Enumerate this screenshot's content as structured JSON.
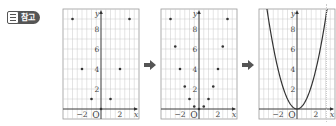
{
  "badge": {
    "label": "참고",
    "icon": "document-icon"
  },
  "arrows": [
    {
      "icon": "right-arrow-icon"
    },
    {
      "icon": "right-arrow-icon"
    }
  ],
  "graphs": {
    "axis_labels": {
      "x": "x",
      "y": "y",
      "origin": "O"
    },
    "x_ticks": [
      "−2",
      "2"
    ],
    "y_ticks": [
      "2",
      "4",
      "6",
      "8"
    ]
  },
  "chart_data": [
    {
      "type": "scatter",
      "title": "",
      "xlabel": "x",
      "ylabel": "y",
      "xlim": [
        -4,
        4
      ],
      "ylim": [
        -1,
        10
      ],
      "grid": true,
      "x": [
        -3,
        -2,
        -1,
        0,
        1,
        2,
        3
      ],
      "y": [
        9,
        4,
        1,
        0,
        1,
        4,
        9
      ]
    },
    {
      "type": "scatter",
      "title": "",
      "xlabel": "x",
      "ylabel": "y",
      "xlim": [
        -4,
        4
      ],
      "ylim": [
        -1,
        10
      ],
      "grid": true,
      "x": [
        -3,
        -2.5,
        -2,
        -1.5,
        -1,
        -0.5,
        0,
        0.5,
        1,
        1.5,
        2,
        2.5,
        3
      ],
      "y": [
        9,
        6.25,
        4,
        2.25,
        1,
        0.25,
        0,
        0.25,
        1,
        2.25,
        4,
        6.25,
        9
      ]
    },
    {
      "type": "line",
      "title": "",
      "xlabel": "x",
      "ylabel": "y",
      "xlim": [
        -4,
        4
      ],
      "ylim": [
        -1,
        10
      ],
      "grid": true,
      "function": "y = x^2",
      "x": [
        -3.3,
        -3,
        -2,
        -1,
        0,
        1,
        2,
        3,
        3.3
      ],
      "y": [
        10.89,
        9,
        4,
        1,
        0,
        1,
        4,
        9,
        10.89
      ]
    }
  ]
}
